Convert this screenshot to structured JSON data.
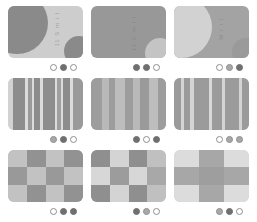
{
  "palette": {
    "page_background": "#ffffff",
    "tone_dark": "#8a8a8a",
    "tone_mid": "#a9a9a9",
    "tone_light": "#c9c9c9",
    "tone_pale": "#dcdcdc",
    "dot_filled": "#6f6f6f",
    "dot_mid": "#a8a8a8",
    "dot_hollow_border": "#8e8e8e"
  },
  "grid": {
    "columns": 3,
    "rows": 3,
    "cells": [
      {
        "id": "cell-1-1",
        "row": 1,
        "col": 1,
        "pattern": "arcs",
        "caption": "",
        "background": "#cdcdcd",
        "shapes": [
          {
            "name": "large-arc-top-left",
            "color": "#8a8a8a",
            "left": -22,
            "top": -14,
            "size": 62
          },
          {
            "name": "small-circle-bottom-right",
            "color": "#8a8a8a",
            "left": 56,
            "top": 30,
            "size": 30
          }
        ],
        "label_text": "11 S m i l",
        "label_left": 46,
        "label_top": 6,
        "dots": [
          "hollow",
          "filled",
          "hollow"
        ]
      },
      {
        "id": "cell-1-2",
        "row": 1,
        "col": 2,
        "pattern": "arcs",
        "caption": "",
        "background": "#989898",
        "shapes": [
          {
            "name": "small-circle-bottom-right",
            "color": "#c4c4c4",
            "left": 54,
            "top": 32,
            "size": 30
          }
        ],
        "label_text": "11 C m l l",
        "label_left": 40,
        "label_top": 10,
        "dots": [
          "filled",
          "filled",
          "hollow"
        ]
      },
      {
        "id": "cell-1-3",
        "row": 1,
        "col": 3,
        "pattern": "arcs",
        "caption": "",
        "background": "#a3a3a3",
        "shapes": [
          {
            "name": "large-arc-left",
            "color": "#d2d2d2",
            "left": -24,
            "top": -10,
            "size": 62
          },
          {
            "name": "small-circle-bottom-right",
            "color": "#9a9a9a",
            "left": 58,
            "top": 32,
            "size": 28
          }
        ],
        "label_text": "M r i l",
        "label_left": 44,
        "label_top": 12,
        "dots": [
          "hollow",
          "mid",
          "filled"
        ]
      },
      {
        "id": "cell-2-1",
        "row": 2,
        "col": 1,
        "pattern": "stripes",
        "caption": "",
        "background": "#d7d7d7",
        "stripes": [
          {
            "color": "#d2d2d2",
            "width": 6
          },
          {
            "color": "#8d8d8d",
            "width": 17
          },
          {
            "color": "#dcdcdc",
            "width": 3
          },
          {
            "color": "#9a9a9a",
            "width": 6
          },
          {
            "color": "#dcdcdc",
            "width": 3
          },
          {
            "color": "#8d8d8d",
            "width": 7
          },
          {
            "color": "#dcdcdc",
            "width": 4
          },
          {
            "color": "#8d8d8d",
            "width": 16
          },
          {
            "color": "#dcdcdc",
            "width": 3
          },
          {
            "color": "#a0a0a0",
            "width": 5
          },
          {
            "color": "#dcdcdc",
            "width": 3
          },
          {
            "color": "#8d8d8d",
            "width": 9
          },
          {
            "color": "#dcdcdc",
            "width": 4
          },
          {
            "color": "#9a9a9a",
            "width": 14
          }
        ],
        "dots": [
          "mid",
          "filled",
          "hollow"
        ]
      },
      {
        "id": "cell-2-2",
        "row": 2,
        "col": 2,
        "pattern": "stripes",
        "caption": "",
        "background": "#b5b5b5",
        "stripes": [
          {
            "color": "#9d9d9d",
            "width": 14
          },
          {
            "color": "#b9b9b9",
            "width": 10
          },
          {
            "color": "#9d9d9d",
            "width": 8
          },
          {
            "color": "#bdbdbd",
            "width": 13
          },
          {
            "color": "#9d9d9d",
            "width": 11
          },
          {
            "color": "#b9b9b9",
            "width": 9
          },
          {
            "color": "#9a9a9a",
            "width": 12
          },
          {
            "color": "#bdbdbd",
            "width": 12
          },
          {
            "color": "#9d9d9d",
            "width": 11
          }
        ],
        "dots": [
          "filled",
          "hollow",
          "filled"
        ]
      },
      {
        "id": "cell-2-3",
        "row": 2,
        "col": 3,
        "pattern": "stripes",
        "caption": "",
        "background": "#c6c6c6",
        "stripes": [
          {
            "color": "#9b9b9b",
            "width": 9
          },
          {
            "color": "#d4d4d4",
            "width": 4
          },
          {
            "color": "#9b9b9b",
            "width": 8
          },
          {
            "color": "#d4d4d4",
            "width": 5
          },
          {
            "color": "#9b9b9b",
            "width": 20
          },
          {
            "color": "#d8d8d8",
            "width": 5
          },
          {
            "color": "#9b9b9b",
            "width": 13
          },
          {
            "color": "#d4d4d4",
            "width": 4
          },
          {
            "color": "#9b9b9b",
            "width": 18
          },
          {
            "color": "#d4d4d4",
            "width": 4
          },
          {
            "color": "#9b9b9b",
            "width": 10
          }
        ],
        "dots": [
          "hollow",
          "mid",
          "mid"
        ]
      },
      {
        "id": "cell-3-1",
        "row": 3,
        "col": 1,
        "pattern": "checker",
        "caption": "",
        "background": "#bcbcbc",
        "checker_cols": 4,
        "checker_rows": 3,
        "checker_colors": [
          "#c2c2c2",
          "#929292",
          "#c2c2c2",
          "#929292",
          "#999999",
          "#c2c2c2",
          "#999999",
          "#c2c2c2",
          "#c2c2c2",
          "#929292",
          "#c2c2c2",
          "#929292"
        ],
        "dots": [
          "hollow",
          "filled",
          "filled"
        ]
      },
      {
        "id": "cell-3-2",
        "row": 3,
        "col": 2,
        "pattern": "checker",
        "caption": "",
        "background": "#c8c8c8",
        "checker_cols": 4,
        "checker_rows": 3,
        "checker_colors": [
          "#8f8f8f",
          "#d4d4d4",
          "#8f8f8f",
          "#c0c0c0",
          "#d7d7d7",
          "#9c9c9c",
          "#d7d7d7",
          "#a8a8a8",
          "#8f8f8f",
          "#d4d4d4",
          "#8f8f8f",
          "#c0c0c0"
        ],
        "dots": [
          "filled",
          "mid",
          "hollow"
        ]
      },
      {
        "id": "cell-3-3",
        "row": 3,
        "col": 3,
        "pattern": "checker",
        "caption": "",
        "background": "#d6d6d6",
        "checker_cols": 3,
        "checker_rows": 3,
        "checker_colors": [
          "#dcdcdc",
          "#a7a7a7",
          "#dcdcdc",
          "#a7a7a7",
          "#9e9e9e",
          "#a7a7a7",
          "#dcdcdc",
          "#a7a7a7",
          "#dcdcdc"
        ],
        "dots": [
          "mid",
          "filled",
          "hollow"
        ]
      }
    ]
  }
}
